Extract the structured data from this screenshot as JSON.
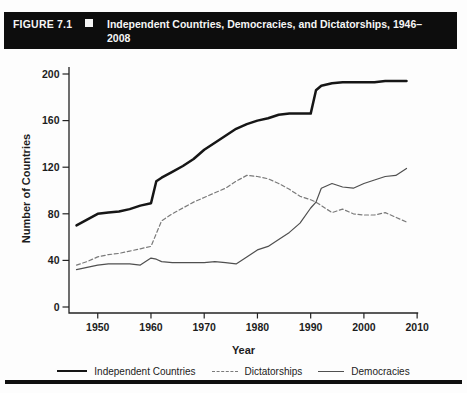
{
  "header": {
    "figure_label": "FIGURE 7.1",
    "title": "Independent Countries, Democracies, and Dictatorships, 1946–2008"
  },
  "chart_data": {
    "type": "line",
    "title": "Independent Countries, Democracies, and Dictatorships, 1946–2008",
    "xlabel": "Year",
    "ylabel": "Number of Countries",
    "xlim": [
      1944.6,
      2010.2
    ],
    "ylim": [
      0,
      200
    ],
    "x_ticks": [
      1950,
      1960,
      1970,
      1980,
      1990,
      2000,
      2010
    ],
    "y_ticks": [
      0,
      40,
      80,
      120,
      160,
      200
    ],
    "grid": false,
    "legend_position": "bottom",
    "x": [
      1946,
      1948,
      1950,
      1952,
      1954,
      1956,
      1958,
      1960,
      1961,
      1962,
      1964,
      1966,
      1968,
      1970,
      1972,
      1974,
      1976,
      1978,
      1980,
      1982,
      1984,
      1986,
      1988,
      1990,
      1991,
      1992,
      1994,
      1996,
      1998,
      2000,
      2002,
      2004,
      2006,
      2008
    ],
    "series": [
      {
        "name": "Independent Countries",
        "style": "solid-thick",
        "color": "#161616",
        "values": [
          70,
          75,
          80,
          81,
          82,
          84,
          87,
          89,
          108,
          111,
          116,
          121,
          127,
          135,
          141,
          147,
          153,
          157,
          160,
          162,
          165,
          166,
          166,
          166,
          186,
          190,
          192,
          193,
          193,
          193,
          193,
          194,
          194,
          194
        ]
      },
      {
        "name": "Dictatorships",
        "style": "dashed",
        "color": "#7a7a7a",
        "values": [
          36,
          39,
          43,
          45,
          46,
          48,
          50,
          52,
          63,
          74,
          80,
          85,
          90,
          94,
          98,
          102,
          108,
          113,
          112,
          110,
          106,
          101,
          95,
          92,
          90,
          87,
          81,
          84,
          80,
          79,
          79,
          81,
          77,
          73
        ]
      },
      {
        "name": "Democracies",
        "style": "solid-thin",
        "color": "#4f4f4f",
        "values": [
          32,
          34,
          36,
          37,
          37,
          37,
          36,
          42,
          41,
          39,
          38,
          38,
          38,
          38,
          39,
          38,
          37,
          43,
          49,
          52,
          58,
          64,
          72,
          85,
          90,
          102,
          106,
          103,
          102,
          106,
          109,
          112,
          113,
          119
        ]
      }
    ]
  },
  "legend": {
    "items": [
      {
        "label": "Independent Countries"
      },
      {
        "label": "Dictatorships"
      },
      {
        "label": "Democracies"
      }
    ]
  }
}
